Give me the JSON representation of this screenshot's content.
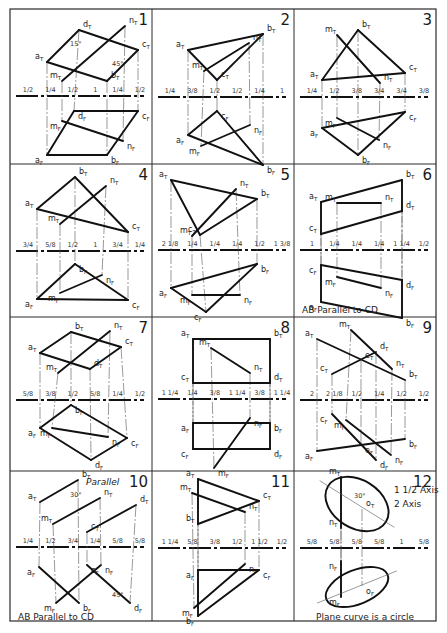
{
  "sheet": {
    "title": "Descriptive geometry problems 1-12",
    "background": "#ffffff",
    "ink": "#111111",
    "grid": {
      "columns": 3,
      "rows": 4,
      "frame": {
        "x": 10,
        "y": 9,
        "w": 426,
        "h": 612
      },
      "col_lines": [
        152,
        294
      ],
      "row_lines": [
        164,
        317,
        471
      ]
    }
  },
  "problems": [
    {
      "number": "1",
      "cell": {
        "x": 10,
        "y": 9
      },
      "ref_y": 87,
      "points": {
        "aT": [
          37,
          53
        ],
        "bT": [
          97,
          72
        ],
        "cT": [
          128,
          41
        ],
        "dT": [
          69,
          21
        ],
        "mT": [
          52,
          72
        ],
        "nT": [
          115,
          17
        ],
        "aF": [
          37,
          146
        ],
        "bF": [
          97,
          146
        ],
        "cF": [
          128,
          102
        ],
        "dF": [
          64,
          102
        ],
        "mF": [
          52,
          112
        ],
        "nF": [
          113,
          132
        ]
      },
      "segments": [
        [
          "aT",
          "bT"
        ],
        [
          "bT",
          "cT"
        ],
        [
          "cT",
          "dT"
        ],
        [
          "dT",
          "aT"
        ],
        [
          "mT",
          "nT"
        ],
        [
          "aF",
          "bF"
        ],
        [
          "bF",
          "cF"
        ],
        [
          "cF",
          "dF"
        ],
        [
          "dF",
          "aF"
        ],
        [
          "mF",
          "nF"
        ]
      ],
      "labels": [
        "a",
        "b",
        "c",
        "d",
        "m",
        "n"
      ],
      "dimensions": [
        "1/2",
        "1/4",
        "1/2",
        "1",
        "1/4",
        "1/2",
        "1/2",
        "2",
        "1/4",
        "3/4",
        "1/4",
        "2",
        "1 1/4"
      ],
      "angles": [
        "15°",
        "45°"
      ],
      "caption": ""
    },
    {
      "number": "2",
      "cell": {
        "x": 152,
        "y": 9
      },
      "ref_y": 88,
      "points": {
        "aT": [
          36,
          41
        ],
        "bT": [
          111,
          25
        ],
        "cT": [
          65,
          71
        ],
        "mT": [
          52,
          62
        ],
        "nT": [
          97,
          34
        ],
        "aF": [
          36,
          126
        ],
        "bF": [
          111,
          156
        ],
        "cF": [
          65,
          102
        ],
        "mF": [
          49,
          137
        ],
        "nF": [
          98,
          116
        ]
      },
      "segments": [
        [
          "aT",
          "bT"
        ],
        [
          "bT",
          "cT"
        ],
        [
          "cT",
          "aT"
        ],
        [
          "mT",
          "nT"
        ],
        [
          "aF",
          "bF"
        ],
        [
          "bF",
          "cF"
        ],
        [
          "cF",
          "aF"
        ],
        [
          "mF",
          "nF"
        ]
      ],
      "labels": [
        "a",
        "b",
        "c",
        "m",
        "n"
      ],
      "dimensions": [
        "1/4",
        "3/8",
        "1/2",
        "1/2",
        "1/4",
        "1",
        "1/2",
        "1 3/8",
        "2",
        "1/4",
        "5/8",
        "3/4",
        "1/4",
        "2 1/4"
      ],
      "angles": [],
      "caption": ""
    },
    {
      "number": "3",
      "cell": {
        "x": 294,
        "y": 9
      },
      "ref_y": 88,
      "points": {
        "aT": [
          28,
          71
        ],
        "bT": [
          64,
          21
        ],
        "cT": [
          111,
          64
        ],
        "mT": [
          43,
          26
        ],
        "nT": [
          86,
          74
        ],
        "aF": [
          28,
          119
        ],
        "bF": [
          64,
          146
        ],
        "cF": [
          111,
          103
        ],
        "mF": [
          43,
          109
        ],
        "nF": [
          85,
          131
        ]
      },
      "segments": [
        [
          "aT",
          "bT"
        ],
        [
          "bT",
          "cT"
        ],
        [
          "cT",
          "aT"
        ],
        [
          "mT",
          "nT"
        ],
        [
          "aF",
          "bF"
        ],
        [
          "bF",
          "cF"
        ],
        [
          "cF",
          "aF"
        ],
        [
          "mF",
          "nF"
        ]
      ],
      "labels": [
        "a",
        "b",
        "c",
        "m",
        "n"
      ],
      "dimensions": [
        "1/4",
        "1/2",
        "3/8",
        "3/4",
        "3/4",
        "3/8",
        "3/4",
        "1/4",
        "2",
        "2 1/8",
        "5/8",
        "1 1/4",
        "2"
      ],
      "angles": [],
      "caption": ""
    },
    {
      "number": "4",
      "cell": {
        "x": 10,
        "y": 164
      },
      "ref_y": 87,
      "points": {
        "aT": [
          27,
          45
        ],
        "bT": [
          65,
          13
        ],
        "cT": [
          118,
          68
        ],
        "mT": [
          50,
          60
        ],
        "nT": [
          96,
          22
        ],
        "aF": [
          27,
          135
        ],
        "bF": [
          65,
          100
        ],
        "cF": [
          118,
          136
        ],
        "mF": [
          50,
          129
        ],
        "nF": [
          92,
          111
        ]
      },
      "segments": [
        [
          "aT",
          "bT"
        ],
        [
          "bT",
          "cT"
        ],
        [
          "cT",
          "aT"
        ],
        [
          "mT",
          "nT"
        ],
        [
          "aF",
          "bF"
        ],
        [
          "bF",
          "cF"
        ],
        [
          "cF",
          "aF"
        ],
        [
          "mF",
          "nF"
        ]
      ],
      "labels": [
        "a",
        "b",
        "c",
        "m",
        "n"
      ],
      "dimensions": [
        "3/4",
        "5/8",
        "1/2",
        "1",
        "3/4",
        "1/4",
        "2 1/4",
        "1 3/8",
        "1/4",
        "1 1/4",
        "5/8",
        "1 1/4",
        "1 1/4"
      ],
      "angles": [],
      "caption": ""
    },
    {
      "number": "5",
      "cell": {
        "x": 152,
        "y": 164
      },
      "ref_y": 86,
      "points": {
        "aT": [
          19,
          16
        ],
        "bT": [
          105,
          35
        ],
        "cT": [
          48,
          71
        ],
        "mT": [
          40,
          72
        ],
        "nT": [
          84,
          25
        ],
        "aF": [
          19,
          124
        ],
        "bF": [
          105,
          100
        ],
        "cF": [
          54,
          148
        ],
        "mF": [
          40,
          131
        ],
        "nF": [
          88,
          131
        ]
      },
      "segments": [
        [
          "aT",
          "bT"
        ],
        [
          "bT",
          "cT"
        ],
        [
          "cT",
          "aT"
        ],
        [
          "mT",
          "nT"
        ],
        [
          "aF",
          "bF"
        ],
        [
          "bF",
          "cF"
        ],
        [
          "cF",
          "aF"
        ],
        [
          "mF",
          "nF"
        ]
      ],
      "labels": [
        "a",
        "b",
        "c",
        "m",
        "n"
      ],
      "dimensions": [
        "2 1/8",
        "1/4",
        "1/4",
        "1/4",
        "1/2",
        "1 3/8",
        "1/4",
        "1",
        "3/8",
        "1/2",
        "1/4",
        "1/4",
        "1 1/4",
        "2"
      ],
      "angles": [],
      "caption": ""
    },
    {
      "number": "6",
      "cell": {
        "x": 294,
        "y": 164
      },
      "ref_y": 86,
      "points": {
        "aT": [
          27,
          38
        ],
        "bT": [
          108,
          16
        ],
        "cT": [
          27,
          70
        ],
        "dT": [
          108,
          47
        ],
        "mT": [
          43,
          39
        ],
        "nT": [
          87,
          39
        ],
        "aF": [
          27,
          138
        ],
        "bF": [
          108,
          154
        ],
        "cF": [
          27,
          101
        ],
        "dF": [
          108,
          116
        ],
        "mF": [
          43,
          113
        ],
        "nF": [
          87,
          124
        ]
      },
      "segments": [
        [
          "aT",
          "bT"
        ],
        [
          "bT",
          "dT"
        ],
        [
          "dT",
          "cT"
        ],
        [
          "cT",
          "aT"
        ],
        [
          "mT",
          "nT"
        ],
        [
          "aF",
          "bF"
        ],
        [
          "bF",
          "dF"
        ],
        [
          "dF",
          "cF"
        ],
        [
          "cF",
          "aF"
        ],
        [
          "mF",
          "nF"
        ]
      ],
      "labels": [
        "a",
        "b",
        "c",
        "d",
        "m",
        "n"
      ],
      "dimensions": [
        "1",
        "1/4",
        "1/4",
        "1/4",
        "1 1/4",
        "1/2",
        "1 1/2",
        "3/4",
        "1 1/4",
        "1 1/4",
        "3/8",
        "1 1/4",
        "3/4"
      ],
      "angles": [],
      "caption": "AB Parallel to CD"
    },
    {
      "number": "7",
      "cell": {
        "x": 10,
        "y": 317
      },
      "ref_y": 83,
      "points": {
        "aT": [
          30,
          36
        ],
        "bT": [
          61,
          15
        ],
        "cT": [
          111,
          30
        ],
        "dT": [
          80,
          52
        ],
        "mT": [
          48,
          56
        ],
        "nT": [
          100,
          14
        ],
        "aF": [
          30,
          111
        ],
        "bF": [
          61,
          88
        ],
        "cF": [
          117,
          121
        ],
        "dF": [
          81,
          143
        ],
        "mF": [
          42,
          111
        ],
        "nF": [
          98,
          120
        ]
      },
      "segments": [
        [
          "aT",
          "bT"
        ],
        [
          "bT",
          "cT"
        ],
        [
          "cT",
          "dT"
        ],
        [
          "dT",
          "aT"
        ],
        [
          "mT",
          "nT"
        ],
        [
          "aF",
          "bF"
        ],
        [
          "bF",
          "cF"
        ],
        [
          "cF",
          "dF"
        ],
        [
          "dF",
          "aF"
        ],
        [
          "mF",
          "nF"
        ]
      ],
      "labels": [
        "a",
        "b",
        "c",
        "d",
        "m",
        "n"
      ],
      "dimensions": [
        "5/8",
        "3/8",
        "1/2",
        "5/8",
        "1/4",
        "1/2",
        "5/8",
        "2 1/4",
        "2 1/8",
        "1 1/4",
        "3/8",
        "3/8",
        "3/8",
        "1/4",
        "2 1/8",
        "3/8"
      ],
      "angles": [],
      "caption": ""
    },
    {
      "number": "8",
      "cell": {
        "x": 152,
        "y": 317
      },
      "ref_y": 82,
      "points": {
        "aT": [
          41,
          22
        ],
        "bT": [
          118,
          22
        ],
        "cT": [
          41,
          66
        ],
        "dT": [
          118,
          66
        ],
        "mT": [
          59,
          31
        ],
        "nT": [
          98,
          56
        ],
        "aF": [
          41,
          106
        ],
        "bF": [
          118,
          106
        ],
        "cF": [
          41,
          132
        ],
        "dF": [
          118,
          132
        ],
        "mF": [
          62,
          151
        ],
        "nF": [
          98,
          101
        ]
      },
      "segments": [
        [
          "aT",
          "bT"
        ],
        [
          "bT",
          "dT"
        ],
        [
          "dT",
          "cT"
        ],
        [
          "cT",
          "aT"
        ],
        [
          "mT",
          "nT"
        ],
        [
          "aF",
          "bF"
        ],
        [
          "bF",
          "dF"
        ],
        [
          "dF",
          "cF"
        ],
        [
          "cF",
          "aF"
        ],
        [
          "mF",
          "nF"
        ]
      ],
      "labels": [
        "a",
        "b",
        "c",
        "d",
        "m",
        "n"
      ],
      "dimensions": [
        "1 1/4",
        "1/4",
        "3/8",
        "1 1/4",
        "3/8",
        "1 1/4",
        "3/8",
        "5/8",
        "1/4",
        "2 1/4",
        "5/8"
      ],
      "angles": [],
      "caption": ""
    },
    {
      "number": "9",
      "cell": {
        "x": 294,
        "y": 317
      },
      "ref_y": 83,
      "points": {
        "aT": [
          23,
          22
        ],
        "bT": [
          111,
          63
        ],
        "cT": [
          38,
          57
        ],
        "dT": [
          82,
          35
        ],
        "mT": [
          57,
          13
        ],
        "nT": [
          98,
          52
        ],
        "eT": [
          67,
          44
        ],
        "aF": [
          23,
          134
        ],
        "bF": [
          111,
          122
        ],
        "cF": [
          38,
          97
        ],
        "dF": [
          82,
          143
        ],
        "mF": [
          52,
          103
        ],
        "nF": [
          97,
          138
        ],
        "eF": [
          67,
          128
        ]
      },
      "segments": [
        [
          "aT",
          "bT"
        ],
        [
          "cT",
          "dT"
        ],
        [
          "mT",
          "nT"
        ],
        [
          "aF",
          "bF"
        ],
        [
          "cF",
          "dF"
        ],
        [
          "mF",
          "nF"
        ]
      ],
      "labels": [
        "a",
        "b",
        "c",
        "d",
        "e",
        "m",
        "n"
      ],
      "dimensions": [
        "2",
        "2 1/8",
        "1/2",
        "1/4",
        "1/2",
        "1/2",
        "1/2",
        "1/2",
        "1/2",
        "1/4",
        "1/4",
        "5/8",
        "1/4",
        "1 1/4",
        "1 3/8",
        "1 1/4"
      ],
      "angles": [],
      "caption": ""
    },
    {
      "number": "10",
      "cell": {
        "x": 10,
        "y": 471
      },
      "ref_y": 76,
      "points": {
        "aT": [
          30,
          31
        ],
        "bT": [
          68,
          9
        ],
        "cT": [
          77,
          61
        ],
        "dT": [
          126,
          34
        ],
        "mT": [
          43,
          53
        ],
        "nT": [
          90,
          27
        ],
        "aF": [
          29,
          96
        ],
        "bF": [
          69,
          132
        ],
        "cF": [
          77,
          94
        ],
        "dF": [
          120,
          132
        ],
        "mF": [
          46,
          132
        ],
        "nF": [
          91,
          94
        ]
      },
      "segments": [
        [
          "aT",
          "bT"
        ],
        [
          "cT",
          "dT"
        ],
        [
          "mT",
          "nT"
        ],
        [
          "aF",
          "bF"
        ],
        [
          "cF",
          "dF"
        ],
        [
          "mF",
          "nF"
        ]
      ],
      "labels": [
        "a",
        "b",
        "c",
        "d",
        "m",
        "n"
      ],
      "dimensions": [
        "1/4",
        "1/2",
        "3/4",
        "1/4",
        "5/8",
        "5/8",
        "3/8",
        "3/8",
        "3/8",
        "5/8"
      ],
      "angles": [
        "30°",
        "45°"
      ],
      "annotation": "Parallel",
      "caption": "AB Parallel to CD"
    },
    {
      "number": "11",
      "cell": {
        "x": 152,
        "y": 471
      },
      "ref_y": 77,
      "points": {
        "aT": [
          46,
          8
        ],
        "bT": [
          46,
          53
        ],
        "cT": [
          107,
          30
        ],
        "mT": [
          40,
          22
        ],
        "nT": [
          93,
          41
        ],
        "aF": [
          46,
          99
        ],
        "bF": [
          46,
          145
        ],
        "cF": [
          107,
          99
        ],
        "mF": [
          42,
          137
        ],
        "nF": [
          93,
          93
        ]
      },
      "segments": [
        [
          "aT",
          "cT"
        ],
        [
          "cT",
          "bT"
        ],
        [
          "bT",
          "aT"
        ],
        [
          "mT",
          "nT"
        ],
        [
          "aF",
          "cF"
        ],
        [
          "cF",
          "bF"
        ],
        [
          "bF",
          "aF"
        ],
        [
          "mF",
          "nF"
        ]
      ],
      "labels": [
        "a",
        "b",
        "c",
        "m",
        "n"
      ],
      "dimensions": [
        "1 1/4",
        "5/8",
        "3/8",
        "1/2",
        "1 1/2",
        "1/2",
        "5/8",
        "1/4",
        "1/4",
        "3/8",
        "2",
        "1 1/4"
      ],
      "angles": [],
      "caption": ""
    },
    {
      "number": "12",
      "cell": {
        "x": 294,
        "y": 471
      },
      "ref_y": 77,
      "points": {
        "mT": [
          47,
          6
        ],
        "nT": [
          47,
          57
        ],
        "oT": [
          68,
          38
        ],
        "nF": [
          47,
          90
        ],
        "mF": [
          47,
          126
        ],
        "oF": [
          68,
          115
        ]
      },
      "segments": [
        [
          "mT",
          "nT"
        ],
        [
          "nF",
          "mF"
        ]
      ],
      "ellipses": [
        {
          "cx": 63,
          "cy": 33,
          "rx": 34,
          "ry": 24,
          "rotate": 32
        },
        {
          "cx": 63,
          "cy": 116,
          "rx": 33,
          "ry": 17,
          "rotate": -22
        }
      ],
      "labels": [
        "m",
        "n",
        "o"
      ],
      "dimensions": [
        "5/8",
        "5/8",
        "5/8",
        "5/8",
        "1",
        "5/8",
        "1 1/4",
        "1 1/4"
      ],
      "angles": [
        "30°"
      ],
      "annotations": [
        "1 1/2 Axis",
        "2 Axis"
      ],
      "caption": "Plane curve is a circle"
    }
  ]
}
